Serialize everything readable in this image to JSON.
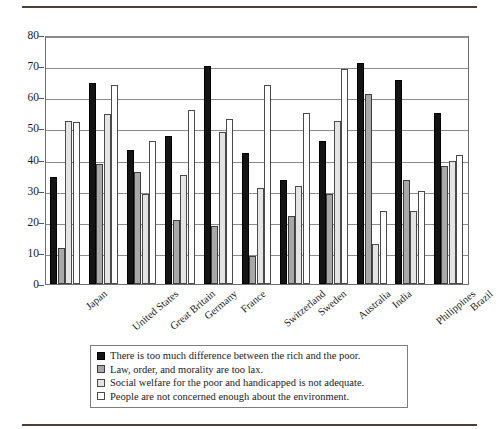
{
  "figure": {
    "rule_top": "horizontal-rule",
    "rule_bottom": "horizontal-rule"
  },
  "chart_data": {
    "type": "bar",
    "title": "",
    "xlabel": "",
    "ylabel": "",
    "ylim": [
      0,
      80
    ],
    "yticks": [
      0,
      10,
      20,
      30,
      40,
      50,
      60,
      70,
      80
    ],
    "grid": true,
    "legend_position": "bottom",
    "categories": [
      "Japan",
      "United States",
      "Great Britain",
      "Germany",
      "France",
      "Switzerland",
      "Sweden",
      "Australia",
      "India",
      "Philippines",
      "Brazil"
    ],
    "series": [
      {
        "name": "There is too much difference between the rich and the poor.",
        "color": "#141414",
        "values": [
          34.5,
          64.5,
          43,
          47.5,
          70,
          42,
          33.5,
          46,
          71,
          65.5,
          55
        ]
      },
      {
        "name": "Law, order, and morality are too lax.",
        "color": "#a8a8a8",
        "values": [
          11.5,
          38.5,
          36,
          20.5,
          18.5,
          9,
          22,
          29,
          61,
          33.5,
          38
        ]
      },
      {
        "name": "Social welfare for the poor and handicapped is not adequate.",
        "color": "#e4e4e4",
        "values": [
          52.5,
          54.5,
          29,
          35,
          49,
          31,
          31.5,
          52.5,
          13,
          23.5,
          39.5
        ]
      },
      {
        "name": "People are not concerned enough about the environment.",
        "color": "#ffffff",
        "values": [
          52,
          64,
          46,
          56,
          53,
          64,
          55,
          69,
          23.5,
          30,
          41.5
        ]
      }
    ]
  }
}
